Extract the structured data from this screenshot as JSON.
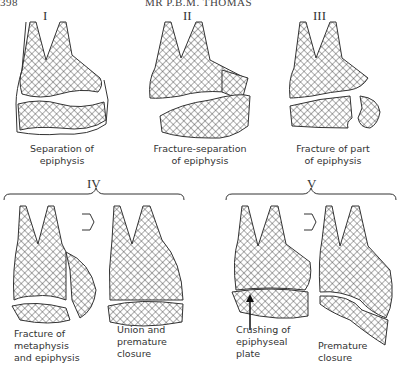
{
  "header": {
    "page_number": "398",
    "author": "MR P.B.M. THOMAS"
  },
  "figure": {
    "types": [
      {
        "numeral": "I",
        "caption_line1": "Separation of",
        "caption_line2": "epiphysis"
      },
      {
        "numeral": "II",
        "caption_line1": "Fracture-separation",
        "caption_line2": "of epiphysis"
      },
      {
        "numeral": "III",
        "caption_line1": "Fracture of part",
        "caption_line2": "of epiphysis"
      },
      {
        "numeral": "IV",
        "panels": [
          {
            "caption_line1": "Fracture of",
            "caption_line2": "metaphysis",
            "caption_line3": "and epiphysis"
          },
          {
            "caption_line1": "Union and",
            "caption_line2": "premature",
            "caption_line3": "closure"
          }
        ]
      },
      {
        "numeral": "V",
        "panels": [
          {
            "caption_line1": "Crushing of",
            "caption_line2": "epiphyseal",
            "caption_line3": "plate"
          },
          {
            "caption_line1": "Premature",
            "caption_line2": "closure"
          }
        ]
      }
    ]
  }
}
